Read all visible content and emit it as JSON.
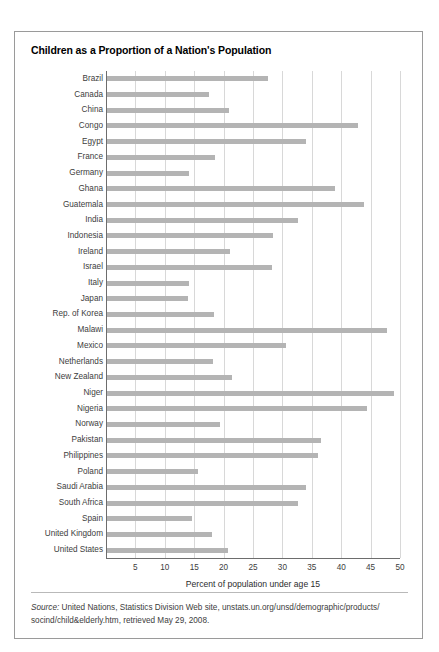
{
  "chart_data": {
    "type": "bar",
    "orientation": "horizontal",
    "title": "Children as a Proportion of a Nation's Population",
    "xlabel": "Percent of population under age 15",
    "ylabel": "",
    "xlim": [
      0,
      50
    ],
    "xticks": [
      5,
      10,
      15,
      20,
      25,
      30,
      35,
      40,
      45,
      50
    ],
    "grid": true,
    "legend": null,
    "bar_color": "#b4b4b4",
    "categories": [
      "Brazil",
      "Canada",
      "China",
      "Congo",
      "Egypt",
      "France",
      "Germany",
      "Ghana",
      "Guatemala",
      "India",
      "Indonesia",
      "Ireland",
      "Israel",
      "Italy",
      "Japan",
      "Rep. of Korea",
      "Malawi",
      "Mexico",
      "Netherlands",
      "New Zealand",
      "Niger",
      "Nigeria",
      "Norway",
      "Pakistan",
      "Philippines",
      "Poland",
      "Saudi Arabia",
      "South Africa",
      "Spain",
      "United Kingdom",
      "United States"
    ],
    "values": [
      27.4,
      17.3,
      20.8,
      42.7,
      33.8,
      18.3,
      13.9,
      38.8,
      43.7,
      32.5,
      28.2,
      20.9,
      28.0,
      14.0,
      13.8,
      18.2,
      47.7,
      30.4,
      18.1,
      21.3,
      48.8,
      44.3,
      19.2,
      36.4,
      35.8,
      15.4,
      33.9,
      32.4,
      14.4,
      17.8,
      20.5
    ]
  },
  "source": {
    "prefix": "Source:",
    "text": " United Nations, Statistics Division Web site, unstats.un.org/unsd/demographic/products/ socind/child&elderly.htm, retrieved May 29, 2008."
  }
}
